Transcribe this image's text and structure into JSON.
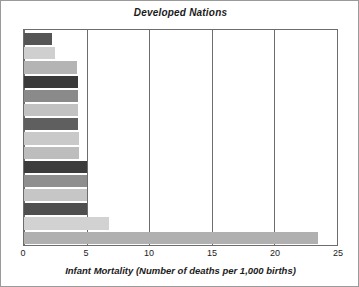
{
  "chart_data": {
    "type": "bar",
    "orientation": "horizontal",
    "title": "Developed Nations",
    "xlabel": "Infant Mortality (Number of deaths per 1,000 births)",
    "ylabel": "",
    "xlim": [
      0,
      25
    ],
    "xticks": [
      0,
      5,
      10,
      15,
      20,
      25
    ],
    "xtick_labels": [
      "0",
      "5",
      "10",
      "15",
      "20",
      "25"
    ],
    "grid": true,
    "grid_axis": "x",
    "legend": false,
    "categories": [
      "Japan",
      "Sweden",
      "France",
      "Germany",
      "Ireland",
      "Israel",
      "Italy",
      "Netherlands",
      "Spain",
      "Australia",
      "Canada",
      "New Zealand",
      "United Kingdom",
      "United States",
      "Turkey"
    ],
    "values": [
      2.2,
      2.5,
      4.2,
      4.3,
      4.3,
      4.3,
      4.3,
      4.4,
      4.4,
      5.0,
      5.0,
      5.0,
      5.0,
      6.8,
      23.5
    ],
    "bar_colors": [
      "#555555",
      "#cfcfcf",
      "#b4b4b4",
      "#3a3a3a",
      "#8a8a8a",
      "#c2c2c2",
      "#5f5f5f",
      "#c9c9c9",
      "#bdbdbd",
      "#3c3c3c",
      "#8f8f8f",
      "#c6c6c6",
      "#4f4f4f",
      "#d2d2d2",
      "#b0b0b0"
    ]
  },
  "figure": {
    "frame_color": "#6d6d6d",
    "background": "#ffffff",
    "text_color": "#1b1b1b"
  }
}
